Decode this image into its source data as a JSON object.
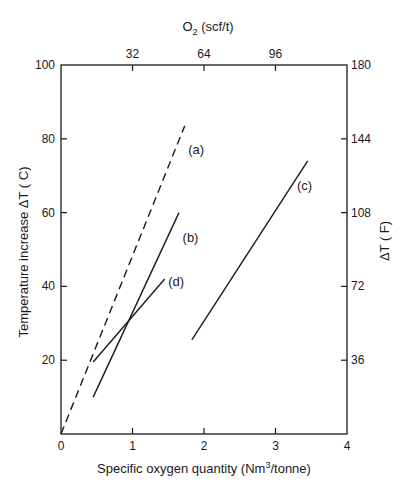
{
  "chart_data": {
    "type": "line",
    "title": "",
    "xlabel": "Specific oxygen quantity (Nm",
    "xlabel_sup": "3",
    "xlabel_tail": "/tonne)",
    "ylabel": "Temperature increase ΔT ( C)",
    "top_xlabel": "O",
    "top_xlabel_sub": "2",
    "top_xlabel_tail": " (scf/t)",
    "right_ylabel": "ΔT ( F)",
    "xlim": [
      0,
      4
    ],
    "ylim": [
      0,
      100
    ],
    "x_ticks": [
      0,
      1,
      2,
      3,
      4
    ],
    "x_tick_labels": [
      "0",
      "1",
      "2",
      "3",
      "4"
    ],
    "y_ticks": [
      0,
      20,
      40,
      60,
      80,
      100
    ],
    "y_tick_labels": [
      "",
      "20",
      "40",
      "60",
      "80",
      "100"
    ],
    "top_ticks_at_x": [
      1,
      2,
      3
    ],
    "top_tick_labels": [
      "32",
      "64",
      "96"
    ],
    "right_ticks_at_y": [
      20,
      40,
      60,
      80,
      100
    ],
    "right_tick_labels": [
      "36",
      "72",
      "108",
      "144",
      "180"
    ],
    "grid": false,
    "legend": "none (inline labels)",
    "series": [
      {
        "name": "(a)",
        "style": "dashed",
        "x": [
          0,
          1.73
        ],
        "y": [
          0,
          83.5
        ],
        "label_at": [
          1.78,
          76
        ]
      },
      {
        "name": "(b)",
        "style": "solid",
        "x": [
          0.45,
          1.65
        ],
        "y": [
          10,
          60
        ],
        "label_at": [
          1.7,
          52
        ]
      },
      {
        "name": "(c)",
        "style": "solid",
        "x": [
          1.83,
          3.45
        ],
        "y": [
          25.5,
          74
        ],
        "label_at": [
          3.3,
          66
        ]
      },
      {
        "name": "(d)",
        "style": "solid",
        "x": [
          0.45,
          1.45
        ],
        "y": [
          19.5,
          42
        ],
        "label_at": [
          1.5,
          40
        ]
      }
    ],
    "colors": {
      "line": "#1a1a1a",
      "axis": "#1a1a1a"
    }
  }
}
